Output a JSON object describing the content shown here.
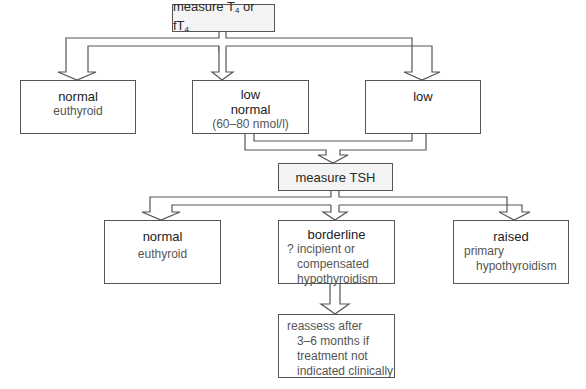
{
  "flowchart": {
    "start": {
      "label": "measure T",
      "sub1": "4",
      "mid": " or fT",
      "sub2": "4"
    },
    "t4_results": [
      {
        "heading": "normal",
        "detail": [
          "euthyroid"
        ]
      },
      {
        "heading": "low",
        "heading2": "normal",
        "detail": [
          "(60–80 nmol/l)"
        ]
      },
      {
        "heading": "low",
        "detail": []
      }
    ],
    "tsh_step": {
      "label": "measure TSH"
    },
    "tsh_results": [
      {
        "heading": "normal",
        "detail": [
          "euthyroid"
        ]
      },
      {
        "heading": "borderline",
        "detail": [
          "? incipient or",
          "compensated",
          "hypothyroidism"
        ]
      },
      {
        "heading": "raised",
        "detail": [
          "primary",
          "hypothyroidism"
        ]
      }
    ],
    "final": {
      "lines": [
        "reassess after",
        "3–6 months if",
        "treatment not",
        "indicated clinically"
      ]
    }
  },
  "colors": {
    "line": "#555555",
    "fill": "#ffffff",
    "shaded_fill": "#f4f4f4"
  }
}
